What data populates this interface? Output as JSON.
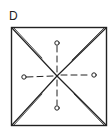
{
  "panel_label": "D",
  "diagram": {
    "shape": "square",
    "square": {
      "x1": 11,
      "y1": 27,
      "x2": 106,
      "y2": 125
    },
    "center": {
      "x": 57,
      "y": 76
    },
    "diagonals": "double-line X from corners to center",
    "markers": [
      {
        "name": "top",
        "x": 57,
        "y": 43
      },
      {
        "name": "right",
        "x": 94,
        "y": 75
      },
      {
        "name": "bottom",
        "x": 57,
        "y": 108
      },
      {
        "name": "left",
        "x": 24,
        "y": 77
      }
    ],
    "line_color": "#222222"
  }
}
